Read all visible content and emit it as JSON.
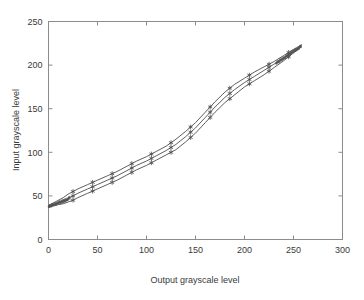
{
  "chart_data": {
    "type": "line",
    "title": "",
    "xlabel": "Output grayscale level",
    "ylabel": "Input grayscale level",
    "xlim": [
      0,
      300
    ],
    "ylim": [
      0,
      250
    ],
    "xticks": [
      0,
      50,
      100,
      150,
      200,
      250,
      300
    ],
    "yticks": [
      0,
      50,
      100,
      150,
      200,
      250
    ],
    "xticklabels": [
      "0",
      "50",
      "100",
      "150",
      "200",
      "250",
      "300"
    ],
    "yticklabels": [
      "0",
      "50",
      "100",
      "150",
      "200",
      "250"
    ],
    "grid": false,
    "legend": null,
    "line_color": "#4d4d4d",
    "marker": "asterisk",
    "x": [
      0,
      5,
      10,
      15,
      20,
      25,
      30,
      40,
      50,
      60,
      70,
      80,
      90,
      100,
      110,
      120,
      130,
      140,
      150,
      160,
      170,
      180,
      190,
      200,
      210,
      220,
      230,
      240,
      250,
      258
    ],
    "series": [
      {
        "name": "mean",
        "values": [
          38,
          40,
          42,
          44,
          47,
          50,
          53,
          58,
          63,
          68,
          73,
          79,
          85,
          90,
          96,
          102,
          109,
          118,
          128,
          140,
          152,
          163,
          172,
          180,
          187,
          194,
          201,
          208,
          216,
          222
        ]
      },
      {
        "name": "upper",
        "values": [
          39,
          42,
          45,
          48,
          52,
          55,
          58,
          63,
          68,
          73,
          78,
          84,
          90,
          95,
          101,
          107,
          115,
          124,
          134,
          146,
          158,
          169,
          178,
          185,
          192,
          198,
          204,
          211,
          218,
          223
        ]
      },
      {
        "name": "lower",
        "values": [
          37,
          39,
          40,
          41,
          43,
          45,
          48,
          53,
          58,
          63,
          68,
          74,
          80,
          85,
          91,
          97,
          103,
          112,
          122,
          134,
          146,
          157,
          166,
          175,
          182,
          189,
          197,
          205,
          214,
          221
        ]
      }
    ],
    "marker_x": [
      25,
      45,
      65,
      85,
      105,
      125,
      145,
      165,
      185,
      205,
      225,
      245
    ],
    "scatter_cloud": {
      "note": "dense overlapping samples near both ends",
      "left_x_range": [
        0,
        22
      ],
      "right_x_range": [
        232,
        258
      ]
    }
  }
}
